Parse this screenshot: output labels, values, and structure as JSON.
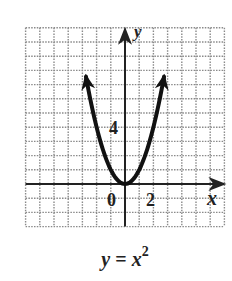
{
  "chart_data": {
    "type": "line",
    "title": "",
    "function": "y = x^2",
    "caption": {
      "lhs": "y",
      "eq": "=",
      "base": "x",
      "exp": "2"
    },
    "xlabel": "x",
    "ylabel": "y",
    "xlim": [
      -7,
      7
    ],
    "ylim": [
      -3,
      11
    ],
    "grid": true,
    "grid_step": 1,
    "tick_labels": {
      "x": [
        "0",
        "2"
      ],
      "y": [
        "4"
      ]
    },
    "curve_domain": [
      -2.75,
      2.75
    ],
    "series": [
      {
        "name": "y = x^2",
        "x": [
          -2.75,
          -2,
          -1,
          0,
          1,
          2,
          2.75
        ],
        "y": [
          7.56,
          4,
          1,
          0,
          1,
          4,
          7.56
        ]
      }
    ],
    "arrows_on_ends": true,
    "colors": {
      "grid": "#8a8a8a",
      "axis": "#222222",
      "curve": "#111111"
    }
  }
}
